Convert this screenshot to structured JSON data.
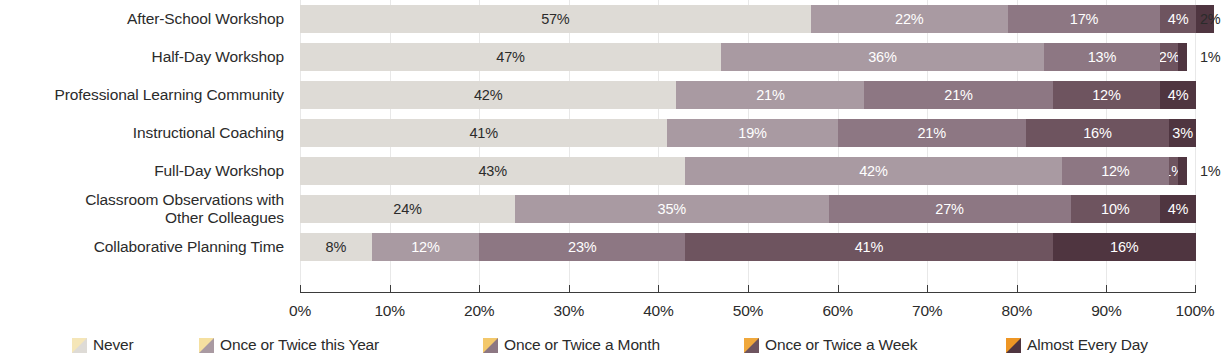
{
  "chart_data": {
    "type": "bar",
    "subtype": "horizontal-stacked-100",
    "title": "",
    "xlabel": "",
    "ylabel": "",
    "xlim": [
      0,
      100
    ],
    "grid": true,
    "legend_position": "bottom",
    "categories": [
      "After-School Workshop",
      "Half-Day Workshop",
      "Professional Learning Community",
      "Instructional Coaching",
      "Full-Day Workshop",
      "Classroom Observations with Other Colleagues",
      "Collaborative Planning Time"
    ],
    "series": [
      {
        "name": "Never",
        "color": "#dedbd6",
        "values": [
          57,
          47,
          42,
          41,
          43,
          24,
          8
        ]
      },
      {
        "name": "Once or Twice this Year",
        "color": "#a99aa2",
        "values": [
          22,
          36,
          21,
          19,
          42,
          35,
          12
        ]
      },
      {
        "name": "Once or Twice a Month",
        "color": "#8d7783",
        "values": [
          17,
          13,
          21,
          21,
          12,
          27,
          23
        ]
      },
      {
        "name": "Once or Twice a Week",
        "color": "#6e545f",
        "values": [
          4,
          2,
          12,
          16,
          1,
          10,
          41
        ]
      },
      {
        "name": "Almost Every Day",
        "color": "#4f3540",
        "values": [
          2,
          1,
          4,
          3,
          1,
          4,
          16
        ]
      }
    ],
    "xticks": [
      {
        "value": 0,
        "label": "0%"
      },
      {
        "value": 10,
        "label": "10%"
      },
      {
        "value": 20,
        "label": "20%"
      },
      {
        "value": 30,
        "label": "30%"
      },
      {
        "value": 40,
        "label": "40%"
      },
      {
        "value": 50,
        "label": "50%"
      },
      {
        "value": 60,
        "label": "60%"
      },
      {
        "value": 70,
        "label": "70%"
      },
      {
        "value": 80,
        "label": "80%"
      },
      {
        "value": 90,
        "label": "90%"
      },
      {
        "value": 100,
        "label": "100%"
      }
    ]
  },
  "rows": [
    {
      "label": "After-School Workshop",
      "label_lines": [
        "After-School Workshop"
      ],
      "segments": [
        {
          "series": "Never",
          "value": 57,
          "text": "57%",
          "color": "#dedbd6",
          "text_color": "dark",
          "show": true
        },
        {
          "series": "Once or Twice this Year",
          "value": 22,
          "text": "22%",
          "color": "#a99aa2",
          "text_color": "light",
          "show": true
        },
        {
          "series": "Once or Twice a Month",
          "value": 17,
          "text": "17%",
          "color": "#8d7783",
          "text_color": "light",
          "show": true
        },
        {
          "series": "Once or Twice a Week",
          "value": 4,
          "text": "4%",
          "color": "#6e545f",
          "text_color": "light",
          "show": true
        },
        {
          "series": "Almost Every Day",
          "value": 2,
          "text": "2%",
          "color": "#4f3540",
          "text_color": "light",
          "show": false
        }
      ],
      "outside_label": "2%"
    },
    {
      "label": "Half-Day Workshop",
      "label_lines": [
        "Half-Day Workshop"
      ],
      "segments": [
        {
          "series": "Never",
          "value": 47,
          "text": "47%",
          "color": "#dedbd6",
          "text_color": "dark",
          "show": true
        },
        {
          "series": "Once or Twice this Year",
          "value": 36,
          "text": "36%",
          "color": "#a99aa2",
          "text_color": "light",
          "show": true
        },
        {
          "series": "Once or Twice a Month",
          "value": 13,
          "text": "13%",
          "color": "#8d7783",
          "text_color": "light",
          "show": true
        },
        {
          "series": "Once or Twice a Week",
          "value": 2,
          "text": "2%",
          "color": "#6e545f",
          "text_color": "light",
          "show": true
        },
        {
          "series": "Almost Every Day",
          "value": 1,
          "text": "1%",
          "color": "#4f3540",
          "text_color": "light",
          "show": false
        }
      ],
      "outside_label": "1%"
    },
    {
      "label": "Professional Learning Community",
      "label_lines": [
        "Professional Learning Community"
      ],
      "segments": [
        {
          "series": "Never",
          "value": 42,
          "text": "42%",
          "color": "#dedbd6",
          "text_color": "dark",
          "show": true
        },
        {
          "series": "Once or Twice this Year",
          "value": 21,
          "text": "21%",
          "color": "#a99aa2",
          "text_color": "light",
          "show": true
        },
        {
          "series": "Once or Twice a Month",
          "value": 21,
          "text": "21%",
          "color": "#8d7783",
          "text_color": "light",
          "show": true
        },
        {
          "series": "Once or Twice a Week",
          "value": 12,
          "text": "12%",
          "color": "#6e545f",
          "text_color": "light",
          "show": true
        },
        {
          "series": "Almost Every Day",
          "value": 4,
          "text": "4%",
          "color": "#4f3540",
          "text_color": "light",
          "show": true
        }
      ],
      "outside_label": ""
    },
    {
      "label": "Instructional Coaching",
      "label_lines": [
        "Instructional Coaching"
      ],
      "segments": [
        {
          "series": "Never",
          "value": 41,
          "text": "41%",
          "color": "#dedbd6",
          "text_color": "dark",
          "show": true
        },
        {
          "series": "Once or Twice this Year",
          "value": 19,
          "text": "19%",
          "color": "#a99aa2",
          "text_color": "light",
          "show": true
        },
        {
          "series": "Once or Twice a Month",
          "value": 21,
          "text": "21%",
          "color": "#8d7783",
          "text_color": "light",
          "show": true
        },
        {
          "series": "Once or Twice a Week",
          "value": 16,
          "text": "16%",
          "color": "#6e545f",
          "text_color": "light",
          "show": true
        },
        {
          "series": "Almost Every Day",
          "value": 3,
          "text": "3%",
          "color": "#4f3540",
          "text_color": "light",
          "show": true
        }
      ],
      "outside_label": ""
    },
    {
      "label": "Full-Day Workshop",
      "label_lines": [
        "Full-Day Workshop"
      ],
      "segments": [
        {
          "series": "Never",
          "value": 43,
          "text": "43%",
          "color": "#dedbd6",
          "text_color": "dark",
          "show": true
        },
        {
          "series": "Once or Twice this Year",
          "value": 42,
          "text": "42%",
          "color": "#a99aa2",
          "text_color": "light",
          "show": true
        },
        {
          "series": "Once or Twice a Month",
          "value": 12,
          "text": "12%",
          "color": "#8d7783",
          "text_color": "light",
          "show": true
        },
        {
          "series": "Once or Twice a Week",
          "value": 1,
          "text": "1%",
          "color": "#6e545f",
          "text_color": "light",
          "show": true
        },
        {
          "series": "Almost Every Day",
          "value": 1,
          "text": "1%",
          "color": "#4f3540",
          "text_color": "light",
          "show": false
        }
      ],
      "outside_label": "1%"
    },
    {
      "label": "Classroom Observations with Other Colleagues",
      "label_lines": [
        "Classroom Observations with",
        "Other Colleagues"
      ],
      "segments": [
        {
          "series": "Never",
          "value": 24,
          "text": "24%",
          "color": "#dedbd6",
          "text_color": "dark",
          "show": true
        },
        {
          "series": "Once or Twice this Year",
          "value": 35,
          "text": "35%",
          "color": "#a99aa2",
          "text_color": "light",
          "show": true
        },
        {
          "series": "Once or Twice a Month",
          "value": 27,
          "text": "27%",
          "color": "#8d7783",
          "text_color": "light",
          "show": true
        },
        {
          "series": "Once or Twice a Week",
          "value": 10,
          "text": "10%",
          "color": "#6e545f",
          "text_color": "light",
          "show": true
        },
        {
          "series": "Almost Every Day",
          "value": 4,
          "text": "4%",
          "color": "#4f3540",
          "text_color": "light",
          "show": true
        }
      ],
      "outside_label": ""
    },
    {
      "label": "Collaborative Planning Time",
      "label_lines": [
        "Collaborative Planning Time"
      ],
      "segments": [
        {
          "series": "Never",
          "value": 8,
          "text": "8%",
          "color": "#dedbd6",
          "text_color": "dark",
          "show": true
        },
        {
          "series": "Once or Twice this Year",
          "value": 12,
          "text": "12%",
          "color": "#a99aa2",
          "text_color": "light",
          "show": true
        },
        {
          "series": "Once or Twice a Month",
          "value": 23,
          "text": "23%",
          "color": "#8d7783",
          "text_color": "light",
          "show": true
        },
        {
          "series": "Once or Twice a Week",
          "value": 41,
          "text": "41%",
          "color": "#6e545f",
          "text_color": "light",
          "show": true
        },
        {
          "series": "Almost Every Day",
          "value": 16,
          "text": "16%",
          "color": "#4f3540",
          "text_color": "light",
          "show": true
        }
      ],
      "outside_label": ""
    }
  ],
  "legend": {
    "items": [
      {
        "label": "Never",
        "color": "#dedbd6",
        "accent": "#f5e6b8",
        "x": 72
      },
      {
        "label": "Once or Twice this Year",
        "color": "#a99aa2",
        "accent": "#f5e0a0",
        "x": 199
      },
      {
        "label": "Once or Twice a Month",
        "color": "#8d7783",
        "accent": "#f3c86b",
        "x": 483
      },
      {
        "label": "Once or Twice a Week",
        "color": "#6e545f",
        "accent": "#f0a83c",
        "x": 744
      },
      {
        "label": "Almost Every Day",
        "color": "#4f3540",
        "accent": "#ee9624",
        "x": 1006
      }
    ]
  },
  "axis": {
    "ticks": [
      "0%",
      "10%",
      "20%",
      "30%",
      "40%",
      "50%",
      "60%",
      "70%",
      "80%",
      "90%",
      "100%"
    ]
  }
}
